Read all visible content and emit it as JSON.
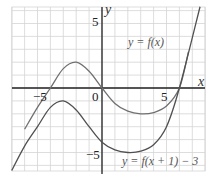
{
  "chart_data": {
    "type": "line",
    "title": "",
    "xlabel": "x",
    "ylabel": "y",
    "xlim": [
      -7,
      8
    ],
    "ylim": [
      -6.5,
      6.3
    ],
    "grid": true,
    "x_ticks": [
      {
        "value": -5,
        "label": "−5"
      },
      {
        "value": 0,
        "label": "0"
      },
      {
        "value": 5,
        "label": "5"
      }
    ],
    "y_ticks": [
      {
        "value": 5,
        "label": "5"
      },
      {
        "value": -5,
        "label": "−5"
      }
    ],
    "series": [
      {
        "name": "y = f(x)",
        "color": "#707070",
        "description": "cubic with roots at x=-4, 0, 6; local max ~(-2.3, 2), local min ~(3.5, -2)",
        "x": [
          -6,
          -5,
          -4,
          -3,
          -2,
          -1,
          0,
          1,
          2,
          3,
          4,
          5,
          6,
          6.7
        ],
        "y": [
          -3.2,
          -1.5,
          0,
          1.5,
          2,
          1.3,
          0,
          -1.2,
          -1.8,
          -2.0,
          -1.9,
          -1.4,
          0,
          2.8
        ]
      },
      {
        "name": "y = f(x + 1) − 3",
        "color": "#505050",
        "description": "f shifted left 1 and down 3",
        "x": [
          -7,
          -6,
          -5,
          -4,
          -3,
          -2,
          -1,
          0,
          1,
          2,
          3,
          4,
          5,
          6,
          7.6
        ],
        "y": [
          -6.4,
          -4.5,
          -3,
          -1.5,
          -1,
          -1.7,
          -3,
          -4.2,
          -4.8,
          -5.0,
          -4.9,
          -4.4,
          -3,
          0,
          6.3
        ]
      }
    ],
    "annotations": [
      {
        "text": "y = f(x)",
        "x": 3.8,
        "y": 3.2
      },
      {
        "text": "y = f(x + 1) − 3",
        "x": 2.3,
        "y": -6.1
      }
    ]
  },
  "labels": {
    "x_axis": "x",
    "y_axis": "y",
    "tick_x_neg5": "−5",
    "tick_x_0": "0",
    "tick_x_5": "5",
    "tick_y_5": "5",
    "tick_y_neg5": "−5",
    "curve1": "y = f(x)",
    "curve2": "y = f(x + 1) − 3"
  }
}
